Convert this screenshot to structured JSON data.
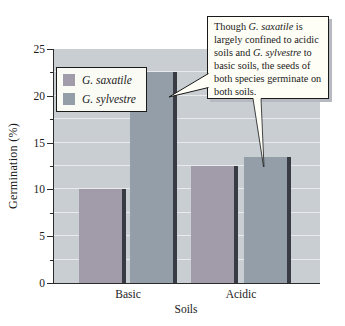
{
  "chart_data": {
    "type": "bar",
    "categories": [
      "Basic",
      "Acidic"
    ],
    "series": [
      {
        "name": "G. saxatile",
        "values": [
          10,
          12.5
        ],
        "color": "#a29caa"
      },
      {
        "name": "G. sylvestre",
        "values": [
          22.5,
          13.5
        ],
        "color": "#939ea9"
      }
    ],
    "title": "",
    "xlabel": "Soils",
    "ylabel": "Germination (%)",
    "ylim": [
      0,
      25
    ],
    "yticks": [
      0,
      5,
      10,
      15,
      20,
      25
    ],
    "ytick_interval": 5,
    "grid_interval": 2.5,
    "grid": true,
    "legend_position": "upper-left"
  },
  "annotation": {
    "segments": [
      {
        "text": "Though ",
        "italic": false
      },
      {
        "text": "G. saxatile",
        "italic": true
      },
      {
        "text": " is largely confined to acidic soils and ",
        "italic": false
      },
      {
        "text": "G. sylvestre",
        "italic": true
      },
      {
        "text": " to basic soils, the seeds of both species germinate on both soils.",
        "italic": false
      }
    ]
  },
  "colors": {
    "plot_bg": "#c9ced3",
    "gridline": "#e8eaec",
    "bar_edge": "#383b43",
    "callout_bg": "#fffef6",
    "callout_shadow": "#b6bac0",
    "axis": "#2b2b2b"
  }
}
